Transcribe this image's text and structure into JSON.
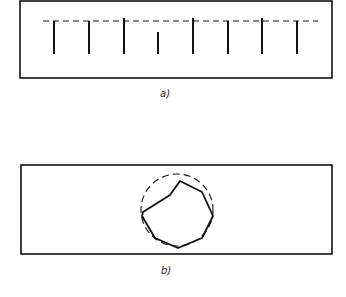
{
  "figure_a": {
    "caption": "a)",
    "box": {
      "x": 20,
      "y": 1,
      "w": 312,
      "h": 77
    },
    "dashed_line": {
      "y": 21,
      "x1": 43,
      "x2": 318
    },
    "ticks": [
      {
        "x": 54,
        "y_top": 21,
        "y_bottom": 54
      },
      {
        "x": 89,
        "y_top": 21,
        "y_bottom": 54
      },
      {
        "x": 124,
        "y_top": 18,
        "y_bottom": 54
      },
      {
        "x": 158,
        "y_top": 32,
        "y_bottom": 54
      },
      {
        "x": 193,
        "y_top": 18,
        "y_bottom": 54
      },
      {
        "x": 228,
        "y_top": 21,
        "y_bottom": 54
      },
      {
        "x": 262,
        "y_top": 18,
        "y_bottom": 54
      },
      {
        "x": 297,
        "y_top": 21,
        "y_bottom": 54
      }
    ]
  },
  "figure_b": {
    "caption": "b)",
    "box": {
      "x": 21,
      "y": 165,
      "w": 311,
      "h": 89
    },
    "circle": {
      "cx": 177,
      "cy": 210,
      "r": 36
    },
    "polygon_points": "142,216 155,238 178,248 202,238 213,216 202,192 180,181 170,195 143,212"
  },
  "colors": {
    "stroke": "#111111",
    "background": "#ffffff"
  }
}
